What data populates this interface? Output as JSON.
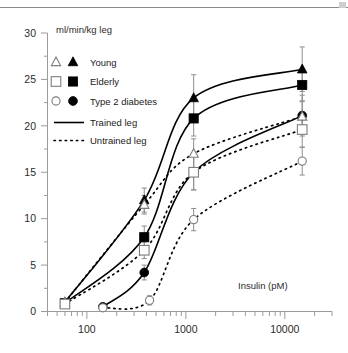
{
  "figure": {
    "y_axis_label": "ml/min/kg leg",
    "x_axis_label": "Insulin (pM)"
  },
  "legend": {
    "entries": [
      {
        "label": "Young",
        "open_symbol": "triangle",
        "filled_symbol": "triangle"
      },
      {
        "label": "Elderly",
        "open_symbol": "square",
        "filled_symbol": "square"
      },
      {
        "label": "Type 2 diabetes",
        "open_symbol": "circle",
        "filled_symbol": "circle"
      }
    ],
    "lines": [
      {
        "label": "Trained leg",
        "style": "solid"
      },
      {
        "label": "Untrained leg",
        "style": "dashed"
      }
    ]
  },
  "axes": {
    "y_ticks": [
      "0",
      "5",
      "10",
      "15",
      "20",
      "25",
      "30"
    ],
    "x_ticks": [
      "100",
      "1000",
      "10000"
    ],
    "y_min": 0,
    "y_max": 30,
    "x_min": 40,
    "x_max": 30000,
    "x_scale": "log"
  },
  "chart_data": {
    "type": "line",
    "title": "",
    "xlabel": "Insulin (pM)",
    "ylabel": "ml/min/kg leg",
    "xscale": "log",
    "xlim": [
      40,
      30000
    ],
    "ylim": [
      0,
      30
    ],
    "grid": false,
    "legend_position": "upper-left",
    "x_tick_labels": [
      "100",
      "1000",
      "10000"
    ],
    "y_tick_labels": [
      "0",
      "5",
      "10",
      "15",
      "20",
      "25",
      "30"
    ],
    "series": [
      {
        "name": "Young - Trained leg",
        "symbol": "filled-triangle",
        "line": "solid",
        "x": [
          60,
          380,
          1200,
          15000
        ],
        "y": [
          1.0,
          12.0,
          23.0,
          26.1
        ],
        "yerr": [
          0.4,
          1.3,
          2.5,
          2.4
        ]
      },
      {
        "name": "Elderly - Trained leg",
        "symbol": "filled-square",
        "line": "solid",
        "x": [
          60,
          380,
          1200,
          15000
        ],
        "y": [
          0.9,
          8.0,
          20.8,
          24.4
        ],
        "yerr": [
          0.4,
          1.2,
          1.9,
          1.7
        ]
      },
      {
        "name": "Type 2 diabetes - Trained leg",
        "symbol": "filled-circle",
        "line": "solid",
        "x": [
          145,
          380,
          1200,
          15000
        ],
        "y": [
          0.5,
          4.2,
          15.0,
          21.1
        ],
        "yerr": [
          0.3,
          0.8,
          1.9,
          2.2
        ]
      },
      {
        "name": "Young - Untrained leg",
        "symbol": "open-triangle",
        "line": "dashed",
        "x": [
          60,
          380,
          1200,
          15000
        ],
        "y": [
          1.0,
          11.5,
          17.0,
          21.0
        ],
        "yerr": [
          0.4,
          1.0,
          1.6,
          1.6
        ]
      },
      {
        "name": "Elderly - Untrained leg",
        "symbol": "open-square",
        "line": "dashed",
        "x": [
          60,
          380,
          1200,
          15000
        ],
        "y": [
          0.8,
          6.6,
          15.0,
          19.6
        ],
        "yerr": [
          0.4,
          0.9,
          1.9,
          1.9
        ]
      },
      {
        "name": "Type 2 diabetes - Untrained leg",
        "symbol": "open-circle",
        "line": "dashed",
        "x": [
          145,
          430,
          1200,
          15000
        ],
        "y": [
          0.4,
          1.2,
          9.9,
          16.2
        ],
        "yerr": [
          0.3,
          0.5,
          1.2,
          1.5
        ]
      }
    ]
  }
}
